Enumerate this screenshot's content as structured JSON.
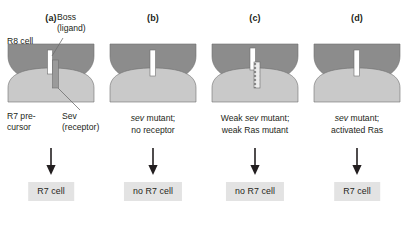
{
  "figure": {
    "background": "#ffffff",
    "colors": {
      "r8_cell": "#8c8c8c",
      "r7_precursor": "#c9c9c9",
      "ligand_bar": "#ffffff",
      "receptor_bar": "#9a9a9a",
      "weak_receptor_bar": "#ededed",
      "outcome_box": "#e3e3e3",
      "text": "#231f20",
      "outline": "#6e6e6e"
    }
  },
  "annotations": {
    "r8_cell": "R8 cell",
    "boss_line1": "Boss",
    "boss_line2": "(ligand)",
    "r7_precursor_line1": "R7 pre-",
    "r7_precursor_line2": "cursor",
    "sev_line1": "Sev",
    "sev_line2": "(receptor)"
  },
  "panels": [
    {
      "label": "(a)",
      "ligand": true,
      "receptor": "full",
      "caption_line1": "",
      "caption_line2": "",
      "caption_italic_word": "",
      "outcome": "R7 cell"
    },
    {
      "label": "(b)",
      "ligand": true,
      "receptor": "none",
      "caption_line1_italic": "sev",
      "caption_line1_rest": " mutant;",
      "caption_line2": "no receptor",
      "outcome": "no R7 cell"
    },
    {
      "label": "(c)",
      "ligand": true,
      "receptor": "weak",
      "caption_line1_pre": "Weak ",
      "caption_line1_italic": "sev",
      "caption_line1_rest": " mutant;",
      "caption_line2": "weak Ras mutant",
      "outcome": "no R7 cell"
    },
    {
      "label": "(d)",
      "ligand": true,
      "receptor": "none",
      "caption_line1_italic": "sev",
      "caption_line1_rest": " mutant;",
      "caption_line2": "activated Ras",
      "outcome": "R7 cell"
    }
  ]
}
